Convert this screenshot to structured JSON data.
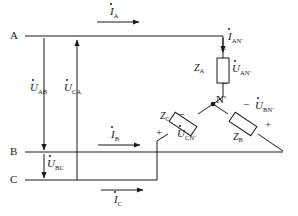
{
  "figure": {
    "type": "three-phase-circuit-schematic",
    "line_color": "#1a1a1a",
    "background": "#ffffff"
  },
  "terminals": [
    {
      "name": "terminal-a",
      "label": "A",
      "x": 14,
      "y": 36
    },
    {
      "name": "terminal-b",
      "label": "B",
      "x": 14,
      "y": 152
    },
    {
      "name": "terminal-c",
      "label": "C",
      "x": 14,
      "y": 180
    }
  ],
  "node": {
    "name": "node-n-prime",
    "label": "N",
    "prime": "'",
    "x": 213,
    "y": 104
  },
  "impedances": [
    {
      "name": "impedance-za",
      "label": "Z",
      "sub": "A",
      "x": 196,
      "y": 68
    },
    {
      "name": "impedance-zb",
      "label": "Z",
      "sub": "B",
      "x": 238,
      "y": 136
    },
    {
      "name": "impedance-zc",
      "label": "Z",
      "sub": "C",
      "x": 163,
      "y": 116
    }
  ],
  "currents": [
    {
      "name": "current-ia",
      "symbol": "I",
      "sub": "A",
      "x": 112,
      "y": 8,
      "direction": "right"
    },
    {
      "name": "current-ib",
      "symbol": "I",
      "sub": "B",
      "x": 113,
      "y": 131,
      "direction": "right"
    },
    {
      "name": "current-ic",
      "symbol": "I",
      "sub": "C",
      "x": 116,
      "y": 197,
      "direction": "right"
    },
    {
      "name": "current-ian",
      "symbol": "I",
      "sub": "AN'",
      "x": 228,
      "y": 35,
      "direction": "down"
    }
  ],
  "voltages": [
    {
      "name": "voltage-uab",
      "symbol": "U",
      "sub": "AB",
      "x": 34,
      "y": 86,
      "direction": "down"
    },
    {
      "name": "voltage-uca",
      "symbol": "U",
      "sub": "CA",
      "x": 67,
      "y": 86,
      "direction": "up"
    },
    {
      "name": "voltage-ubc",
      "symbol": "U",
      "sub": "BC",
      "x": 39,
      "y": 163,
      "direction": "down"
    },
    {
      "name": "voltage-uan",
      "symbol": "U",
      "sub": "AN'",
      "x": 229,
      "y": 62,
      "direction": "down"
    },
    {
      "name": "voltage-ubn",
      "symbol": "U",
      "sub": "BN'",
      "x": 256,
      "y": 103,
      "direction": "up"
    },
    {
      "name": "voltage-ucn",
      "symbol": "U",
      "sub": "CN'",
      "x": 178,
      "y": 132,
      "direction": "up"
    }
  ],
  "polarity_marks": [
    {
      "name": "polarity-plus-za",
      "sign": "+",
      "x": 223,
      "y": 45
    },
    {
      "name": "polarity-minus-za",
      "sign": "−",
      "x": 224,
      "y": 81
    },
    {
      "name": "polarity-minus-zb",
      "sign": "−",
      "x": 245,
      "y": 103
    },
    {
      "name": "polarity-plus-zb",
      "sign": "+",
      "x": 267,
      "y": 124
    },
    {
      "name": "polarity-minus-zc",
      "sign": "−",
      "x": 180,
      "y": 113
    },
    {
      "name": "polarity-plus-zc",
      "sign": "+",
      "x": 158,
      "y": 131
    }
  ]
}
